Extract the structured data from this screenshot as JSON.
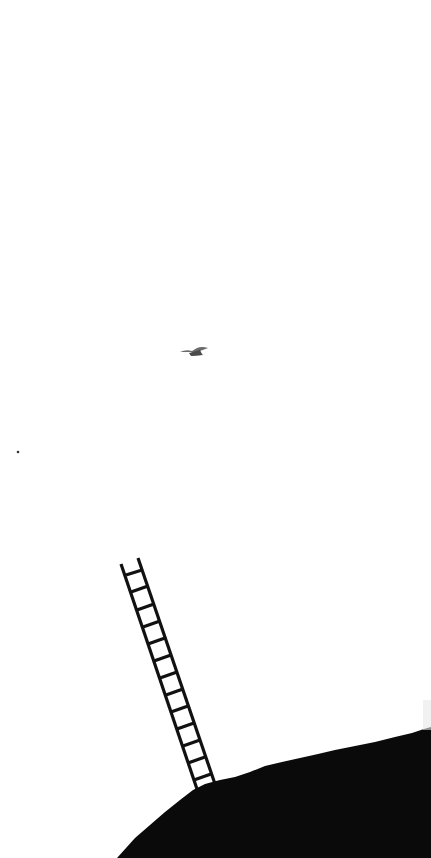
{
  "scene": {
    "description": "Minimalist photo: a ladder leaning up from the top of a dark hill into a white sky, with a small bird flying above",
    "colors": {
      "sky": "#ffffff",
      "hill": "#0a0a0a",
      "ladder": "#111111",
      "bird": "#6b6b6b"
    },
    "elements": [
      "sky",
      "bird",
      "speck",
      "ladder",
      "hill"
    ]
  }
}
